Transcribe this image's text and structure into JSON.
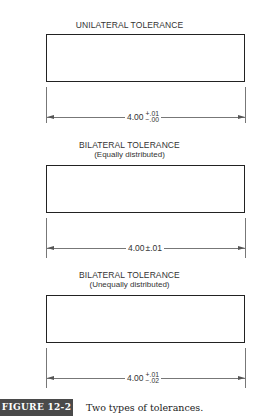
{
  "figures": [
    {
      "title": "UNILATERAL TOLERANCE",
      "subtitle": "",
      "dimension": {
        "nominal": "4.00",
        "tolerance_type": "unilateral",
        "upper": "+.01",
        "lower": "−.00"
      }
    },
    {
      "title": "BILATERAL TOLERANCE",
      "subtitle": "(Equally distributed)",
      "dimension": {
        "nominal": "4.00",
        "tolerance_type": "bilateral-equal",
        "symmetric": "±.01"
      }
    },
    {
      "title": "BILATERAL TOLERANCE",
      "subtitle": "(Unequally distributed)",
      "dimension": {
        "nominal": "4.00",
        "tolerance_type": "bilateral-unequal",
        "upper": "+.01",
        "lower": "−.02"
      }
    }
  ],
  "caption": {
    "label": "FIGURE 12-2",
    "text": "Two types of tolerances.",
    "label_bg_color": "#4a4a4a"
  }
}
